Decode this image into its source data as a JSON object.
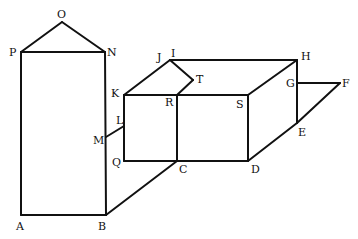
{
  "diagram": {
    "type": "geometric line drawing",
    "labels": {
      "O": "O",
      "P": "P",
      "N": "N",
      "A": "A",
      "B": "B",
      "J": "J",
      "I": "I",
      "H": "H",
      "K": "K",
      "R": "R",
      "S": "S",
      "T": "T",
      "G": "G",
      "F": "F",
      "E": "E",
      "L": "L",
      "M": "M",
      "Q": "Q",
      "C": "C",
      "D": "D"
    },
    "edges": [
      [
        "P",
        "O"
      ],
      [
        "O",
        "N"
      ],
      [
        "P",
        "N"
      ],
      [
        "P",
        "A"
      ],
      [
        "N",
        "B"
      ],
      [
        "A",
        "B"
      ],
      [
        "B",
        "C"
      ],
      [
        "M",
        "L"
      ],
      [
        "K",
        "J"
      ],
      [
        "J",
        "T"
      ],
      [
        "T",
        "R"
      ],
      [
        "J",
        "H"
      ],
      [
        "K",
        "S"
      ],
      [
        "H",
        "S"
      ],
      [
        "K",
        "Q"
      ],
      [
        "R",
        "C"
      ],
      [
        "S",
        "D"
      ],
      [
        "Q",
        "D"
      ],
      [
        "H",
        "E"
      ],
      [
        "G",
        "F"
      ],
      [
        "F",
        "E"
      ],
      [
        "E",
        "D"
      ]
    ]
  }
}
